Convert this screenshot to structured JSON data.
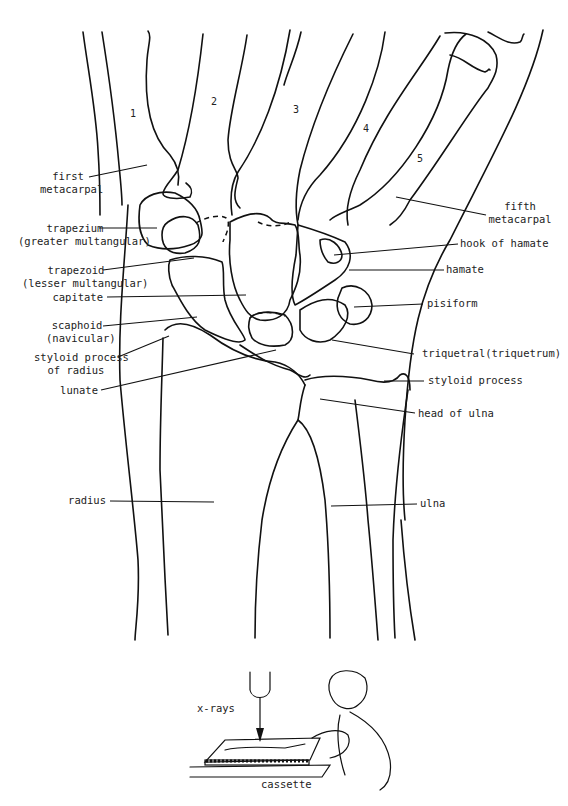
{
  "figure": {
    "digit_numbers": [
      "1",
      "2",
      "3",
      "4",
      "5"
    ],
    "labels_left": [
      {
        "id": "first-metacarpal",
        "lines": [
          "first",
          "metacarpal"
        ]
      },
      {
        "id": "trapezium",
        "lines": [
          "trapezium",
          "(greater multangular)"
        ]
      },
      {
        "id": "trapezoid",
        "lines": [
          "trapezoid",
          "(lesser multangular)"
        ]
      },
      {
        "id": "capitate",
        "lines": [
          "capitate"
        ]
      },
      {
        "id": "scaphoid",
        "lines": [
          "scaphoid",
          "(navicular)"
        ]
      },
      {
        "id": "styloid-process-of-radius",
        "lines": [
          "styloid process",
          "of radius"
        ]
      },
      {
        "id": "lunate",
        "lines": [
          "lunate"
        ]
      },
      {
        "id": "radius",
        "lines": [
          "radius"
        ]
      }
    ],
    "labels_right": [
      {
        "id": "fifth-metacarpal",
        "lines": [
          "fifth",
          "metacarpal"
        ]
      },
      {
        "id": "hook-of-hamate",
        "lines": [
          "hook of hamate"
        ]
      },
      {
        "id": "hamate",
        "lines": [
          "hamate"
        ]
      },
      {
        "id": "pisiform",
        "lines": [
          "pisiform"
        ]
      },
      {
        "id": "triquetral",
        "lines": [
          "triquetral(triquetrum)"
        ]
      },
      {
        "id": "styloid-process",
        "lines": [
          "styloid process"
        ]
      },
      {
        "id": "head-of-ulna",
        "lines": [
          "head of ulna"
        ]
      },
      {
        "id": "ulna",
        "lines": [
          "ulna"
        ]
      }
    ]
  },
  "inset": {
    "xray_label": "x-rays",
    "cassette_label": "cassette"
  }
}
